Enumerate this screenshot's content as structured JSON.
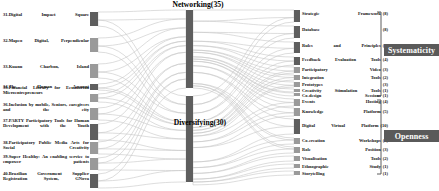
{
  "figure": {
    "type": "sankey",
    "width": 439,
    "height": 191,
    "background": "#ffffff",
    "link_color": "#c8c8c8",
    "node_color": "#9a9a9a",
    "node_color_dark": "#5e5e5e",
    "category_box_color": "#5a5a5a",
    "category_text_color": "#ffffff"
  },
  "stages": {
    "networking": "Networking(35)",
    "diversifying": "Diversifying(30)"
  },
  "categories": {
    "systematicity": "Systematicity",
    "openness": "Openness"
  },
  "sources": [
    {
      "label": "31.Digital Impact Square",
      "value": 7
    },
    {
      "label": "32.Mapeo Digital, Perpendicular",
      "value": 7
    },
    {
      "label": "33.Kuanu Charbon, Island",
      "value": 7
    },
    {
      "label": "34.The Human Account",
      "value": 3
    },
    {
      "label": "35.Financial Library for Ecuadorian Microentrepreneurs",
      "value": 4
    },
    {
      "label": "36.Inclusion by mobile, Seniors, caregivers and the city",
      "value": 6
    },
    {
      "label": "37.PARTY Participatory Tools for Human Development with the Youth",
      "value": 9
    },
    {
      "label": "38.Participatory Public Media Arts for Social Creativity",
      "value": 7
    },
    {
      "label": "39.Super Healthy: An enabling service to empower patients",
      "value": 7
    },
    {
      "label": "40.Brazilian Government Supplier Registration System, GNova",
      "value": 8
    }
  ],
  "targets": [
    {
      "name": "Strategic Framework",
      "count": "(8)",
      "value": 8,
      "group": "systematicity"
    },
    {
      "name": "Database",
      "count": "(8)",
      "value": 8,
      "group": "systematicity"
    },
    {
      "name": "Rules and Principles",
      "count": "(7)",
      "value": 7,
      "group": "systematicity"
    },
    {
      "name": "Feedback Evaluation Tools",
      "count": "(4)",
      "value": 4,
      "group": "systematicity"
    },
    {
      "name": "Participatory Video",
      "count": "(3)",
      "value": 3,
      "group": "systematicity"
    },
    {
      "name": "Integration Tools",
      "count": "(2)",
      "value": 2,
      "group": "systematicity"
    },
    {
      "name": "Prototypes",
      "count": "(3)",
      "value": 3,
      "group": "systematicity"
    },
    {
      "name": "Creativity Stimulation Tools",
      "count": "(1)",
      "value": 1,
      "group": "systematicity"
    },
    {
      "name": "Co-design Sessions",
      "count": "(1)",
      "value": 1,
      "group": "systematicity"
    },
    {
      "name": "Events Hosting",
      "count": "(4)",
      "value": 4,
      "group": "openness"
    },
    {
      "name": "Knowledge Platform",
      "count": "(5)",
      "value": 5,
      "group": "openness"
    },
    {
      "name": "Digital Virtual Platform",
      "count": "(10)",
      "value": 10,
      "group": "openness"
    },
    {
      "name": "Co-creation Workshops",
      "count": "(3)",
      "value": 3,
      "group": "openness"
    },
    {
      "name": "Role Position",
      "count": "(3)",
      "value": 3,
      "group": "openness"
    },
    {
      "name": "Visualisation Tools",
      "count": "(2)",
      "value": 2,
      "group": "openness"
    },
    {
      "name": "Ethnographic Study",
      "count": "(1)",
      "value": 1,
      "group": "openness"
    },
    {
      "name": "Storytelling",
      "count": "(1)",
      "value": 1,
      "group": "openness"
    }
  ],
  "chart_data": {
    "type": "sankey",
    "title": "",
    "stage_nodes": [
      {
        "id": "networking",
        "label": "Networking(35)",
        "value": 35
      },
      {
        "id": "diversifying",
        "label": "Diversifying(30)",
        "value": 30
      }
    ],
    "links_source_to_stage": [
      {
        "source": "31.Digital Impact Square",
        "target": "Networking(35)",
        "value": 4
      },
      {
        "source": "31.Digital Impact Square",
        "target": "Diversifying(30)",
        "value": 3
      },
      {
        "source": "32.Mapeo Digital, Perpendicular",
        "target": "Networking(35)",
        "value": 4
      },
      {
        "source": "32.Mapeo Digital, Perpendicular",
        "target": "Diversifying(30)",
        "value": 3
      },
      {
        "source": "33.Kuanu Charbon, Island",
        "target": "Networking(35)",
        "value": 4
      },
      {
        "source": "33.Kuanu Charbon, Island",
        "target": "Diversifying(30)",
        "value": 3
      },
      {
        "source": "34.The Human Account",
        "target": "Networking(35)",
        "value": 2
      },
      {
        "source": "34.The Human Account",
        "target": "Diversifying(30)",
        "value": 1
      },
      {
        "source": "35.Financial Library for Ecuadorian Microentrepreneurs",
        "target": "Networking(35)",
        "value": 2
      },
      {
        "source": "35.Financial Library for Ecuadorian Microentrepreneurs",
        "target": "Diversifying(30)",
        "value": 2
      },
      {
        "source": "36.Inclusion by mobile, Seniors, caregivers and the city",
        "target": "Networking(35)",
        "value": 3
      },
      {
        "source": "36.Inclusion by mobile, Seniors, caregivers and the city",
        "target": "Diversifying(30)",
        "value": 3
      },
      {
        "source": "37.PARTY Participatory Tools for Human Development with the Youth",
        "target": "Networking(35)",
        "value": 5
      },
      {
        "source": "37.PARTY Participatory Tools for Human Development with the Youth",
        "target": "Diversifying(30)",
        "value": 4
      },
      {
        "source": "38.Participatory Public Media Arts for Social Creativity",
        "target": "Networking(35)",
        "value": 4
      },
      {
        "source": "38.Participatory Public Media Arts for Social Creativity",
        "target": "Diversifying(30)",
        "value": 3
      },
      {
        "source": "39.Super Healthy: An enabling service to empower patients",
        "target": "Networking(35)",
        "value": 3
      },
      {
        "source": "39.Super Healthy: An enabling service to empower patients",
        "target": "Diversifying(30)",
        "value": 4
      },
      {
        "source": "40.Brazilian Government Supplier Registration System, GNova",
        "target": "Networking(35)",
        "value": 4
      },
      {
        "source": "40.Brazilian Government Supplier Registration System, GNova",
        "target": "Diversifying(30)",
        "value": 4
      }
    ],
    "links_stage_to_target": [
      {
        "source": "Networking(35)",
        "target": "Strategic Framework",
        "value": 5
      },
      {
        "source": "Networking(35)",
        "target": "Database",
        "value": 5
      },
      {
        "source": "Networking(35)",
        "target": "Rules and Principles",
        "value": 4
      },
      {
        "source": "Networking(35)",
        "target": "Feedback Evaluation Tools",
        "value": 2
      },
      {
        "source": "Networking(35)",
        "target": "Participatory Video",
        "value": 2
      },
      {
        "source": "Networking(35)",
        "target": "Integration Tools",
        "value": 1
      },
      {
        "source": "Networking(35)",
        "target": "Prototypes",
        "value": 2
      },
      {
        "source": "Networking(35)",
        "target": "Creativity Stimulation Tools",
        "value": 1
      },
      {
        "source": "Networking(35)",
        "target": "Co-design Sessions",
        "value": 1
      },
      {
        "source": "Networking(35)",
        "target": "Events Hosting",
        "value": 2
      },
      {
        "source": "Networking(35)",
        "target": "Knowledge Platform",
        "value": 3
      },
      {
        "source": "Networking(35)",
        "target": "Digital Virtual Platform",
        "value": 5
      },
      {
        "source": "Networking(35)",
        "target": "Co-creation Workshops",
        "value": 1
      },
      {
        "source": "Networking(35)",
        "target": "Role Position",
        "value": 1
      },
      {
        "source": "Diversifying(30)",
        "target": "Strategic Framework",
        "value": 3
      },
      {
        "source": "Diversifying(30)",
        "target": "Database",
        "value": 3
      },
      {
        "source": "Diversifying(30)",
        "target": "Rules and Principles",
        "value": 3
      },
      {
        "source": "Diversifying(30)",
        "target": "Feedback Evaluation Tools",
        "value": 2
      },
      {
        "source": "Diversifying(30)",
        "target": "Participatory Video",
        "value": 1
      },
      {
        "source": "Diversifying(30)",
        "target": "Integration Tools",
        "value": 1
      },
      {
        "source": "Diversifying(30)",
        "target": "Prototypes",
        "value": 1
      },
      {
        "source": "Diversifying(30)",
        "target": "Events Hosting",
        "value": 2
      },
      {
        "source": "Diversifying(30)",
        "target": "Knowledge Platform",
        "value": 2
      },
      {
        "source": "Diversifying(30)",
        "target": "Digital Virtual Platform",
        "value": 5
      },
      {
        "source": "Diversifying(30)",
        "target": "Co-creation Workshops",
        "value": 2
      },
      {
        "source": "Diversifying(30)",
        "target": "Role Position",
        "value": 2
      },
      {
        "source": "Diversifying(30)",
        "target": "Visualisation Tools",
        "value": 2
      },
      {
        "source": "Diversifying(30)",
        "target": "Ethnographic Study",
        "value": 1
      },
      {
        "source": "Diversifying(30)",
        "target": "Storytelling",
        "value": 1
      }
    ]
  }
}
